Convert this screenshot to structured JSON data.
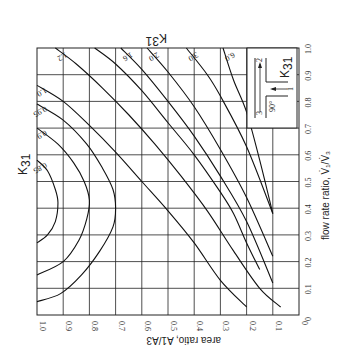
{
  "chart_data": {
    "type": "line",
    "title_rotated": "K31",
    "orientation": "rotated 90 degrees (page rotated clockwise)",
    "xlabel": "area ratio, A1/A3",
    "ylabel": "flow rate ratio, V̇1/V̇3",
    "xlim": [
      1.0,
      0
    ],
    "ylim": [
      0,
      1.0
    ],
    "x_ticks": [
      "1.0",
      "0.9",
      "0.8",
      "0.7",
      "0.6",
      "0.5",
      "0.4",
      "0.3",
      "0.2",
      "0.1",
      "0"
    ],
    "y_ticks": [
      "0",
      "0.1",
      "0.2",
      "0.3",
      "0.4",
      "0.5",
      "0.6",
      "0.7",
      "0.8",
      "0.9",
      "1.0"
    ],
    "grid": true,
    "inset": {
      "labels": [
        "3",
        "2",
        "1",
        "90°",
        "K31"
      ],
      "description": "tee junction diagram, branch 1 joining at 90°"
    },
    "series": [
      {
        "name": "0.85",
        "points": [
          [
            1.0,
            0.58
          ],
          [
            0.96,
            0.54
          ],
          [
            0.93,
            0.47
          ],
          [
            0.92,
            0.42
          ],
          [
            0.93,
            0.35
          ],
          [
            0.96,
            0.3
          ],
          [
            1.0,
            0.27
          ]
        ]
      },
      {
        "name": "0.9",
        "points": [
          [
            1.0,
            0.7
          ],
          [
            0.92,
            0.64
          ],
          [
            0.86,
            0.57
          ],
          [
            0.82,
            0.5
          ],
          [
            0.8,
            0.43
          ],
          [
            0.81,
            0.36
          ],
          [
            0.84,
            0.28
          ],
          [
            0.9,
            0.2
          ],
          [
            1.0,
            0.15
          ]
        ]
      },
      {
        "name": "0.95",
        "points": [
          [
            1.0,
            0.79
          ],
          [
            0.9,
            0.73
          ],
          [
            0.81,
            0.64
          ],
          [
            0.75,
            0.55
          ],
          [
            0.71,
            0.47
          ],
          [
            0.7,
            0.4
          ],
          [
            0.71,
            0.33
          ],
          [
            0.76,
            0.24
          ],
          [
            0.83,
            0.15
          ],
          [
            0.91,
            0.08
          ],
          [
            1.0,
            0.05
          ]
        ]
      },
      {
        "name": "1.0",
        "points": [
          [
            1.0,
            0.86
          ],
          [
            0.9,
            0.8
          ],
          [
            0.8,
            0.71
          ],
          [
            0.7,
            0.61
          ],
          [
            0.6,
            0.5
          ],
          [
            0.5,
            0.39
          ],
          [
            0.4,
            0.27
          ],
          [
            0.3,
            0.13
          ],
          [
            0.2,
            0.03
          ]
        ]
      },
      {
        "name": "1.2",
        "points": [
          [
            0.93,
            1.0
          ],
          [
            0.85,
            0.94
          ],
          [
            0.75,
            0.85
          ],
          [
            0.65,
            0.75
          ],
          [
            0.55,
            0.64
          ],
          [
            0.45,
            0.52
          ],
          [
            0.35,
            0.39
          ],
          [
            0.25,
            0.24
          ],
          [
            0.15,
            0.1
          ],
          [
            0.07,
            0.03
          ]
        ]
      },
      {
        "name": "1.4",
        "points": [
          [
            0.78,
            1.0
          ],
          [
            0.7,
            0.94
          ],
          [
            0.6,
            0.84
          ],
          [
            0.5,
            0.72
          ],
          [
            0.4,
            0.6
          ],
          [
            0.3,
            0.46
          ],
          [
            0.25,
            0.38
          ],
          [
            0.2,
            0.27
          ],
          [
            0.15,
            0.17
          ]
        ]
      },
      {
        "name": "1.6",
        "points": [
          [
            0.68,
            1.0
          ],
          [
            0.6,
            0.92
          ],
          [
            0.5,
            0.8
          ],
          [
            0.4,
            0.67
          ],
          [
            0.3,
            0.52
          ],
          [
            0.2,
            0.35
          ],
          [
            0.1,
            0.12
          ]
        ]
      },
      {
        "name": "2.0",
        "points": [
          [
            0.58,
            1.0
          ],
          [
            0.5,
            0.91
          ],
          [
            0.4,
            0.78
          ],
          [
            0.3,
            0.62
          ],
          [
            0.2,
            0.44
          ],
          [
            0.1,
            0.22
          ]
        ]
      },
      {
        "name": "3.0",
        "points": [
          [
            0.43,
            1.0
          ],
          [
            0.35,
            0.9
          ],
          [
            0.3,
            0.82
          ],
          [
            0.2,
            0.63
          ],
          [
            0.1,
            0.38
          ]
        ]
      },
      {
        "name": "6.0",
        "points": [
          [
            0.29,
            1.0
          ],
          [
            0.25,
            0.88
          ],
          [
            0.2,
            0.76
          ],
          [
            0.15,
            0.58
          ],
          [
            0.1,
            0.38
          ]
        ]
      }
    ]
  }
}
